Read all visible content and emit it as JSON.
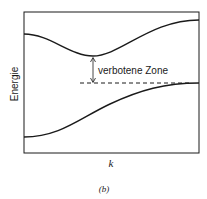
{
  "figure": {
    "y_axis_label": "Energie",
    "x_axis_label": "k",
    "annotation": "verbotene Zone",
    "caption": "(b)"
  },
  "colors": {
    "line": "#1a1a1a",
    "background": "#ffffff"
  }
}
